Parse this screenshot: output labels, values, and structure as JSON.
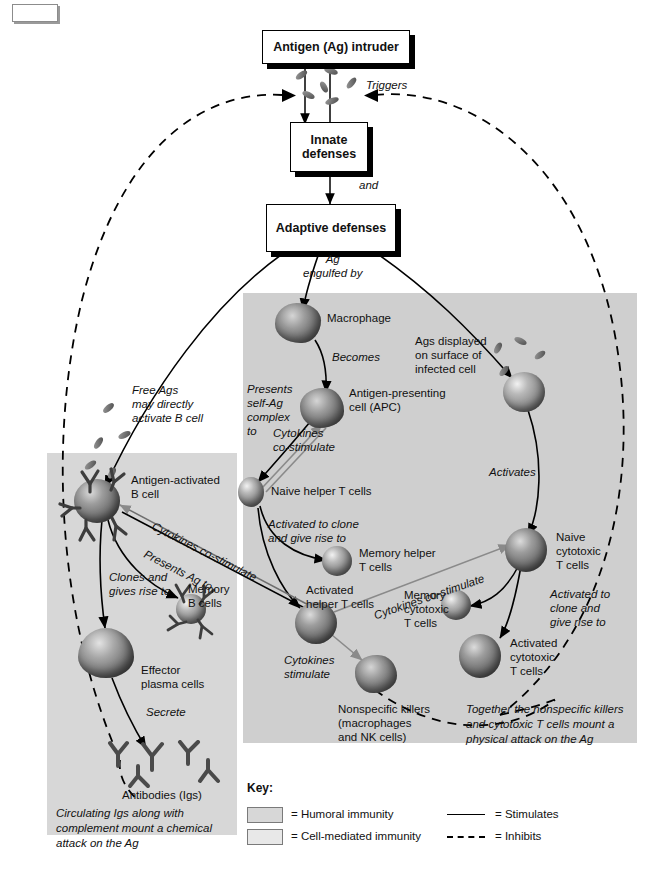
{
  "diagram": {
    "flow_boxes": [
      {
        "id": "antigen",
        "label": "Antigen (Ag) intruder"
      },
      {
        "id": "innate",
        "label": "Innate\ndefenses"
      },
      {
        "id": "adaptive",
        "label": "Adaptive\ndefenses"
      }
    ],
    "connector_labels": {
      "triggers": "Triggers",
      "and": "and",
      "ag_engulfed_by": "Ag\nengulfed by",
      "becomes": "Becomes",
      "presents_self_ag": "Presents\nself-Ag\ncomplex\nto",
      "cytokines_costimulate_apc": "Cytokines\nco-stimulate",
      "activates": "Activates",
      "activated_to_clone_helper": "Activated to clone\nand give rise to",
      "activated_to_clone_cyto": "Activated to\nclone and\ngive rise to",
      "cytokines_costimulate_b": "Cytokines co-stimulate",
      "presents_ag_to": "Presents Ag to",
      "cytokines_costimulate_cyto": "Cytokines co-stimulate",
      "cytokines_stimulate": "Cytokines\nstimulate",
      "clones_and_gives_rise_to": "Clones and\ngives rise to",
      "secrete": "Secrete",
      "free_ags": "Free Ags\nmay directly\nactivate B cell"
    },
    "cell_labels": {
      "macrophage": "Macrophage",
      "apc": "Antigen-presenting\ncell (APC)",
      "infected_cell": "Ags displayed\non surface of\ninfected cell",
      "naive_helper": "Naive helper T cells",
      "memory_helper": "Memory helper\nT cells",
      "activated_helper": "Activated\nhelper T cells",
      "naive_cytotoxic": "Naive\ncytotoxic\nT cells",
      "memory_cytotoxic": "Memory\ncytotoxic\nT cells",
      "activated_cytotoxic": "Activated\ncytotoxic\nT cells",
      "nonspecific_killers": "Nonspecific killers\n(macrophages\nand NK cells)",
      "antigen_activated_b": "Antigen-activated\nB cell",
      "memory_b": "Memory\nB cells",
      "effector_plasma": "Effector\nplasma cells",
      "antibodies": "Antibodies (Igs)"
    },
    "summaries": {
      "humoral": "Circulating Igs along with complement mount a chemical attack on the Ag",
      "cell_mediated": "Together the nonspecific killers and cytotoxic T cells mount a physical attack on the Ag"
    },
    "key": {
      "title": "Key:",
      "items": [
        {
          "type": "swatch",
          "color": "#d7d7d7",
          "label": "= Humoral immunity"
        },
        {
          "type": "swatch",
          "color": "#e8e8e8",
          "label": "= Cell-mediated immunity"
        },
        {
          "type": "line",
          "label": "= Stimulates"
        },
        {
          "type": "dash",
          "label": "= Inhibits"
        }
      ]
    },
    "colors": {
      "cell_mediated_panel": "#cfcfcf",
      "humoral_panel": "#d7d7d7",
      "stroke": "#000000",
      "gray_arrow": "#888888"
    }
  }
}
